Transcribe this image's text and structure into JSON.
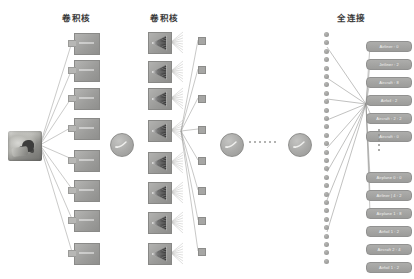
{
  "diagram": {
    "type": "cnn-architecture",
    "titles": {
      "conv1": "卷积核",
      "conv2": "卷积核",
      "fc": "全连接"
    },
    "input": {
      "name": "input-image",
      "alt": "输入图像"
    },
    "layers": {
      "conv1": {
        "block_count": 8,
        "blocks": [
          {
            "y": 33
          },
          {
            "y": 60
          },
          {
            "y": 88
          },
          {
            "y": 118
          },
          {
            "y": 150
          },
          {
            "y": 180
          },
          {
            "y": 210
          },
          {
            "y": 243
          }
        ]
      },
      "conv2": {
        "block_count": 8,
        "blocks": [
          {
            "y": 32
          },
          {
            "y": 61
          },
          {
            "y": 88
          },
          {
            "y": 120
          },
          {
            "y": 152
          },
          {
            "y": 182
          },
          {
            "y": 212
          },
          {
            "y": 243
          }
        ]
      },
      "features": {
        "square_count": 8,
        "squares": [
          {
            "y": 37
          },
          {
            "y": 66
          },
          {
            "y": 95
          },
          {
            "y": 126
          },
          {
            "y": 157
          },
          {
            "y": 187
          },
          {
            "y": 217
          },
          {
            "y": 248
          }
        ]
      },
      "activations": {
        "count": 3,
        "circles": [
          {
            "x": 110,
            "y": 133
          },
          {
            "x": 220,
            "y": 133
          },
          {
            "x": 288,
            "y": 133
          }
        ]
      },
      "fc": {
        "node_count": 28,
        "node_start_y": 32,
        "node_step": 8.4
      }
    },
    "mid_ellipsis": {
      "dot_count": 6
    },
    "label_ellipsis": {
      "dot_count": 5
    },
    "output_labels_top": [
      {
        "text": "Airliner : 0"
      },
      {
        "text": "Jetliner : 2"
      },
      {
        "text": "Aircraft : 8"
      },
      {
        "text": "Airfoil : 2"
      },
      {
        "text": "Aircraft : 2 : 2"
      },
      {
        "text": "Aircraft : 0"
      }
    ],
    "output_labels_bottom": [
      {
        "text": "Airplane 0 : 0"
      },
      {
        "text": "Airliner | 4 : 2"
      },
      {
        "text": "Airplane 1 : 8"
      },
      {
        "text": "Airfoil 1 : 2"
      },
      {
        "text": "Aircraft 2 : 4"
      },
      {
        "text": "Airfoil 1 : 2"
      }
    ],
    "colors": {
      "block_fill": "#9d9d9b",
      "node_fill": "#8f8f8d",
      "label_fill": "#9c9c9a",
      "line": "#8d8d8b",
      "background": "#ffffff",
      "text": "#3a3a3a"
    }
  }
}
